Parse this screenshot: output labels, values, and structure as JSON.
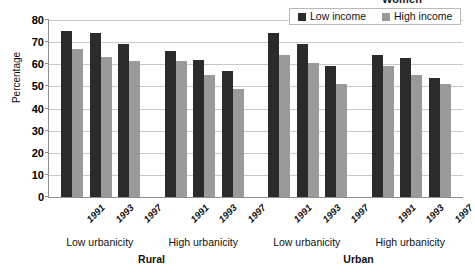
{
  "chart_data": {
    "type": "bar",
    "title": "Women",
    "xlabel": "",
    "ylabel": "Percentage",
    "ylim": [
      0,
      80
    ],
    "yticks": [
      0,
      10,
      20,
      30,
      40,
      50,
      60,
      70,
      80
    ],
    "grid": true,
    "legend_position": "top-right",
    "categories": [
      "1991",
      "1993",
      "1997",
      "1991",
      "1993",
      "1997",
      "1991",
      "1993",
      "1997",
      "1991",
      "1993",
      "1997"
    ],
    "series": [
      {
        "name": "Low income",
        "color": "#2b2b2b",
        "values": [
          75,
          74,
          69,
          66,
          62,
          57,
          74,
          69,
          59,
          64,
          63,
          54
        ]
      },
      {
        "name": "High income",
        "color": "#9a9a9a",
        "values": [
          67,
          63.5,
          61.5,
          61.5,
          55,
          49,
          64,
          60.5,
          51,
          59,
          55,
          51
        ]
      }
    ],
    "group_labels": [
      "Low urbanicity",
      "High urbanicity",
      "Low urbanicity",
      "High urbanicity"
    ],
    "region_labels": [
      "Rural",
      "Urban"
    ]
  },
  "legend": {
    "entries": [
      {
        "label": "Low income"
      },
      {
        "label": "High income"
      }
    ]
  },
  "colors": {
    "low_income": "#2b2b2b",
    "high_income": "#9a9a9a",
    "gridline": "#c9c9c9",
    "axis": "#8f8f8f",
    "text": "#111111"
  }
}
